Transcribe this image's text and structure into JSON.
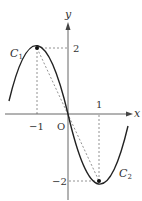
{
  "figure": {
    "axes": {
      "x_label": "x",
      "y_label": "y",
      "origin_label": "O"
    },
    "ticks": {
      "x_neg": "−1",
      "x_pos": "1",
      "y_pos": "2",
      "y_neg": "−2"
    },
    "curves": {
      "c1": {
        "name": "C",
        "sub": "1",
        "vertex": [
          -1,
          2
        ]
      },
      "c2": {
        "name": "C",
        "sub": "2",
        "vertex": [
          1,
          -2
        ]
      }
    },
    "colors": {
      "curve": "#222222",
      "axis": "#555555",
      "dashed": "#777777"
    }
  }
}
